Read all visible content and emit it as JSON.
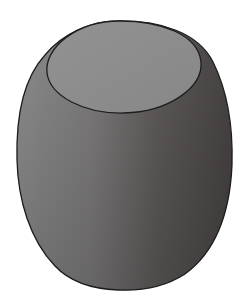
{
  "figure": {
    "width": 243,
    "height": 306,
    "colors": {
      "background": "#ffffff",
      "outline": "#1e1e1e",
      "top_face": "#8e8e8e",
      "body_light": "#8c8c8c",
      "body_mid": "#6e6c6c",
      "body_dark": "#474343"
    }
  }
}
